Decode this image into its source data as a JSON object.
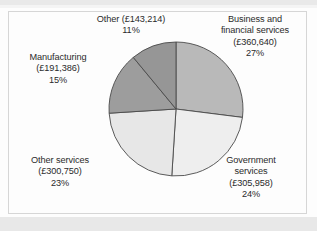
{
  "chart_data": {
    "type": "pie",
    "title": "",
    "subtitle": "",
    "xlabel": "",
    "ylabel": "",
    "legend_position": "none",
    "grid": false,
    "currency_symbol": "£",
    "categories": [
      "Business and financial services",
      "Government services",
      "Other services",
      "Manufacturing",
      "Other"
    ],
    "values": [
      360640,
      305958,
      300750,
      191386,
      143214
    ],
    "percentages": [
      27,
      24,
      23,
      15,
      11
    ],
    "total": 1301948,
    "slices": [
      {
        "name": "Business and financial services",
        "label_line1": "Business and",
        "label_line2": "financial services",
        "label_line3": "(£360,640)",
        "label_line4": "27%",
        "value": 360640,
        "value_text": "(£360,640)",
        "percent": 27,
        "percent_text": "27%",
        "color": "#b9b9b9",
        "start_angle": 0,
        "end_angle": 97.2
      },
      {
        "name": "Government services",
        "label_line1": "Government",
        "label_line2": "services",
        "label_line3": "(£305,958)",
        "label_line4": "24%",
        "value": 305958,
        "value_text": "(£305,958)",
        "percent": 24,
        "percent_text": "24%",
        "color": "#eeeeee",
        "start_angle": 97.2,
        "end_angle": 183.6
      },
      {
        "name": "Other services",
        "label_line1": "Other services",
        "label_line2": "(£300,750)",
        "label_line3": "23%",
        "value": 300750,
        "value_text": "(£300,750)",
        "percent": 23,
        "percent_text": "23%",
        "color": "#e7e7e7",
        "start_angle": 183.6,
        "end_angle": 266.4
      },
      {
        "name": "Manufacturing",
        "label_line1": "Manufacturing",
        "label_line2": "(£191,386)",
        "label_line3": "15%",
        "value": 191386,
        "value_text": "(£191,386)",
        "percent": 15,
        "percent_text": "15%",
        "color": "#9d9d9d",
        "start_angle": 266.4,
        "end_angle": 320.4
      },
      {
        "name": "Other",
        "label_line1": "Other (£143,214)",
        "label_line2": "11%",
        "value": 143214,
        "value_text": "(£143,214)",
        "percent": 11,
        "percent_text": "11%",
        "color": "#969696",
        "start_angle": 320.4,
        "end_angle": 360
      }
    ],
    "geometry": {
      "center_x": 176,
      "center_y": 109,
      "radius": 67,
      "stroke_color": "#4a4a4a",
      "stroke_width": 0.9
    }
  },
  "labels": {
    "other": {
      "line1": "Other (£143,214)",
      "line2": "11%"
    },
    "business": {
      "line1": "Business and",
      "line2": "financial services",
      "line3": "(£360,640)",
      "line4": "27%"
    },
    "manufacturing": {
      "line1": "Manufacturing",
      "line2": "(£191,386)",
      "line3": "15%"
    },
    "other_services": {
      "line1": "Other services",
      "line2": "(£300,750)",
      "line3": "23%"
    },
    "government": {
      "line1": "Government",
      "line2": "services",
      "line3": "(£305,958)",
      "line4": "24%"
    }
  }
}
